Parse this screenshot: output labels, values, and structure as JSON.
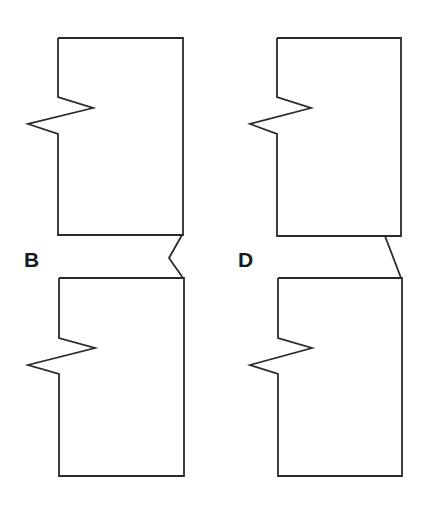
{
  "diagram": {
    "labels": [
      {
        "id": "B",
        "text": "B"
      },
      {
        "id": "D",
        "text": "D"
      }
    ],
    "panels": [
      {
        "name": "B",
        "connector": "zigzag-notch"
      },
      {
        "name": "D",
        "connector": "diagonal-line"
      }
    ],
    "colors": {
      "stroke": "#2a2a2a",
      "background": "#ffffff",
      "label": "#1a1a1a"
    }
  }
}
